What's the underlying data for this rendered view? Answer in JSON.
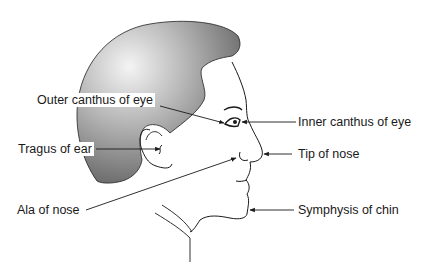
{
  "diagram": {
    "colors": {
      "hair_dark": "#6e6e6e",
      "hair_light": "#f2f2f2",
      "line": "#1a1a1a",
      "background": "#ffffff"
    },
    "labels": [
      {
        "id": "outer-canthus",
        "text": "Outer canthus of eye",
        "side": "left"
      },
      {
        "id": "inner-canthus",
        "text": "Inner canthus of eye",
        "side": "right"
      },
      {
        "id": "tragus",
        "text": "Tragus of ear",
        "side": "left"
      },
      {
        "id": "tip-of-nose",
        "text": "Tip of nose",
        "side": "right"
      },
      {
        "id": "ala-of-nose",
        "text": "Ala of nose",
        "side": "left"
      },
      {
        "id": "symphysis-of-chin",
        "text": "Symphysis of chin",
        "side": "right"
      }
    ]
  }
}
